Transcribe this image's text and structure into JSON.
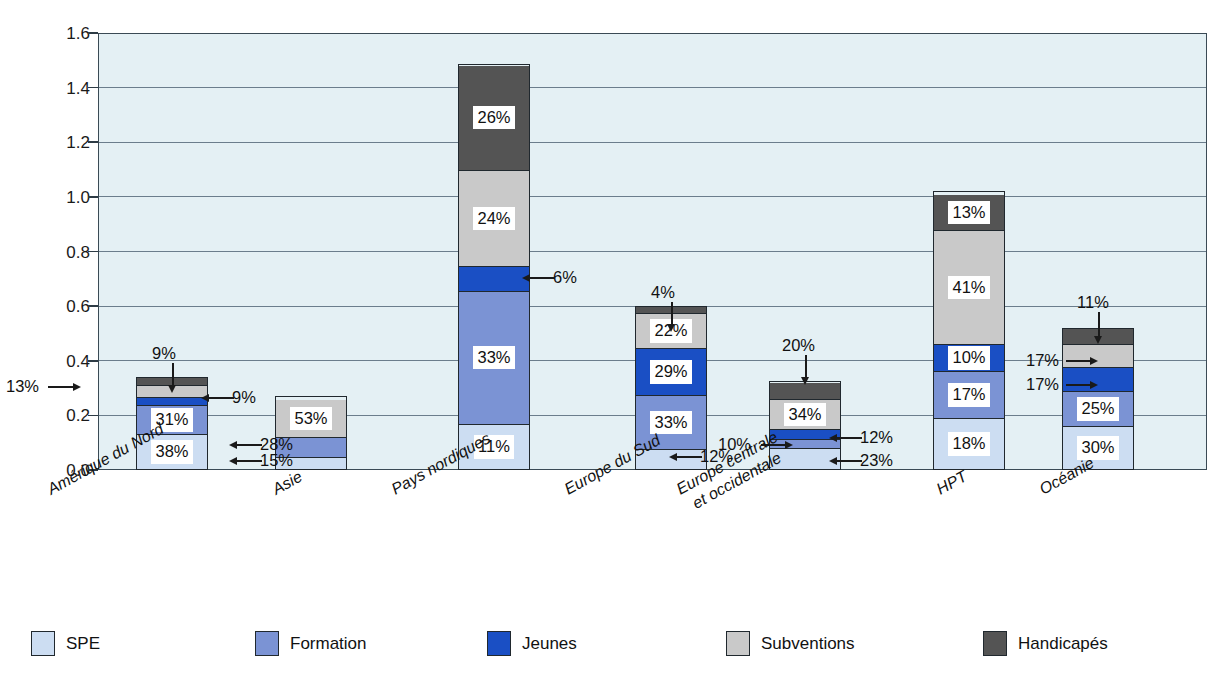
{
  "axis": {
    "ylabel": "% du PIB",
    "yticks": [
      "1.6",
      "1.4",
      "1.2",
      "1.0",
      "0.8",
      "0.6",
      "0.4",
      "0.2",
      "0.0"
    ]
  },
  "legend": {
    "items": [
      {
        "label": "SPE",
        "color": "#ccddf2"
      },
      {
        "label": "Formation",
        "color": "#7b93d4"
      },
      {
        "label": "Jeunes",
        "color": "#1a4fc4"
      },
      {
        "label": "Subventions",
        "color": "#c9c9c9"
      },
      {
        "label": "Handicapés",
        "color": "#545454"
      }
    ]
  },
  "chart_data": {
    "type": "bar",
    "subtype": "stacked",
    "title": "",
    "xlabel": "",
    "ylabel": "% du PIB",
    "ylim": [
      0.0,
      1.6
    ],
    "ytick_step": 0.2,
    "grid": true,
    "legend_position": "bottom",
    "value_unit": "% du PIB",
    "label_unit": "% (part du total)",
    "categories": [
      "Amérique du Nord",
      "Asie",
      "Pays nordiques",
      "Europe du Sud",
      "Europe centrale et occidentale",
      "HPT",
      "Océanie"
    ],
    "series": [
      {
        "name": "SPE",
        "color": "#ccddf2",
        "shares_pct": [
          38,
          15,
          11,
          12,
          23,
          18,
          30
        ],
        "values": [
          0.129,
          0.041,
          0.163,
          0.072,
          0.075,
          0.184,
          0.156
        ]
      },
      {
        "name": "Formation",
        "color": "#7b93d4",
        "shares_pct": [
          31,
          28,
          33,
          33,
          10,
          17,
          25
        ],
        "values": [
          0.105,
          0.076,
          0.49,
          0.198,
          0.033,
          0.173,
          0.13
        ]
      },
      {
        "name": "Jeunes",
        "color": "#1a4fc4",
        "shares_pct": [
          9,
          0,
          6,
          29,
          12,
          10,
          17
        ],
        "values": [
          0.031,
          0.0,
          0.089,
          0.174,
          0.039,
          0.102,
          0.088
        ]
      },
      {
        "name": "Subventions",
        "color": "#c9c9c9",
        "shares_pct": [
          13,
          53,
          24,
          22,
          34,
          41,
          17
        ],
        "values": [
          0.044,
          0.143,
          0.356,
          0.132,
          0.111,
          0.418,
          0.088
        ]
      },
      {
        "name": "Handicapés",
        "color": "#545454",
        "shares_pct": [
          9,
          0,
          26,
          4,
          20,
          13,
          11
        ],
        "values": [
          0.031,
          0.0,
          0.386,
          0.024,
          0.065,
          0.133,
          0.057
        ]
      }
    ],
    "totals": [
      0.34,
      0.27,
      1.485,
      0.6,
      0.325,
      1.02,
      0.52
    ],
    "data_labels": [
      {
        "category": "Amérique du Nord",
        "series": "SPE",
        "text": "38%",
        "placement": "inside"
      },
      {
        "category": "Amérique du Nord",
        "series": "Formation",
        "text": "31%",
        "placement": "inside"
      },
      {
        "category": "Amérique du Nord",
        "series": "Jeunes",
        "text": "9%",
        "placement": "callout-right"
      },
      {
        "category": "Amérique du Nord",
        "series": "Subventions",
        "text": "13%",
        "placement": "callout-left"
      },
      {
        "category": "Amérique du Nord",
        "series": "Handicapés",
        "text": "9%",
        "placement": "callout-top"
      },
      {
        "category": "Asie",
        "series": "SPE",
        "text": "15%",
        "placement": "callout-right"
      },
      {
        "category": "Asie",
        "series": "Formation",
        "text": "28%",
        "placement": "callout-right"
      },
      {
        "category": "Asie",
        "series": "Subventions",
        "text": "53%",
        "placement": "inside"
      },
      {
        "category": "Pays nordiques",
        "series": "SPE",
        "text": "11%",
        "placement": "inside"
      },
      {
        "category": "Pays nordiques",
        "series": "Formation",
        "text": "33%",
        "placement": "inside"
      },
      {
        "category": "Pays nordiques",
        "series": "Jeunes",
        "text": "6%",
        "placement": "callout-right"
      },
      {
        "category": "Pays nordiques",
        "series": "Subventions",
        "text": "24%",
        "placement": "inside"
      },
      {
        "category": "Pays nordiques",
        "series": "Handicapés",
        "text": "26%",
        "placement": "inside"
      },
      {
        "category": "Europe du Sud",
        "series": "SPE",
        "text": "12%",
        "placement": "callout-right"
      },
      {
        "category": "Europe du Sud",
        "series": "Formation",
        "text": "33%",
        "placement": "inside"
      },
      {
        "category": "Europe du Sud",
        "series": "Jeunes",
        "text": "29%",
        "placement": "inside"
      },
      {
        "category": "Europe du Sud",
        "series": "Subventions",
        "text": "22%",
        "placement": "inside"
      },
      {
        "category": "Europe du Sud",
        "series": "Handicapés",
        "text": "4%",
        "placement": "callout-top"
      },
      {
        "category": "Europe centrale et occidentale",
        "series": "SPE",
        "text": "23%",
        "placement": "callout-right"
      },
      {
        "category": "Europe centrale et occidentale",
        "series": "Formation",
        "text": "10%",
        "placement": "callout-left"
      },
      {
        "category": "Europe centrale et occidentale",
        "series": "Jeunes",
        "text": "12%",
        "placement": "callout-right"
      },
      {
        "category": "Europe centrale et occidentale",
        "series": "Subventions",
        "text": "34%",
        "placement": "inside"
      },
      {
        "category": "Europe centrale et occidentale",
        "series": "Handicapés",
        "text": "20%",
        "placement": "callout-top"
      },
      {
        "category": "HPT",
        "series": "SPE",
        "text": "18%",
        "placement": "inside"
      },
      {
        "category": "HPT",
        "series": "Formation",
        "text": "17%",
        "placement": "inside"
      },
      {
        "category": "HPT",
        "series": "Jeunes",
        "text": "10%",
        "placement": "inside"
      },
      {
        "category": "HPT",
        "series": "Subventions",
        "text": "41%",
        "placement": "inside"
      },
      {
        "category": "HPT",
        "series": "Handicapés",
        "text": "13%",
        "placement": "inside"
      },
      {
        "category": "Océanie",
        "series": "SPE",
        "text": "30%",
        "placement": "inside"
      },
      {
        "category": "Océanie",
        "series": "Formation",
        "text": "25%",
        "placement": "inside"
      },
      {
        "category": "Océanie",
        "series": "Jeunes",
        "text": "17%",
        "placement": "callout-left"
      },
      {
        "category": "Océanie",
        "series": "Subventions",
        "text": "17%",
        "placement": "callout-left"
      },
      {
        "category": "Océanie",
        "series": "Handicapés",
        "text": "11%",
        "placement": "callout-top"
      }
    ]
  },
  "xlabels": [
    {
      "lines": [
        "Amérique du Nord"
      ]
    },
    {
      "lines": [
        "Asie"
      ]
    },
    {
      "lines": [
        "Pays nordiques"
      ]
    },
    {
      "lines": [
        "Europe du Sud"
      ]
    },
    {
      "lines": [
        "Europe centrale",
        "et occidentale"
      ]
    },
    {
      "lines": [
        "HPT"
      ]
    },
    {
      "lines": [
        "Océanie"
      ]
    }
  ],
  "callouts": [
    {
      "text": "9%",
      "tx": 152,
      "ty": 345,
      "dir": "down",
      "ax": 172,
      "ay": 363,
      "len": 22
    },
    {
      "text": "13%",
      "tx": 6,
      "ty": 378,
      "dir": "right",
      "ax": 48,
      "ay": 386,
      "len": 25
    },
    {
      "text": "9%",
      "tx": 232,
      "ty": 389,
      "dir": "left",
      "ax": 209,
      "ay": 397,
      "len": 25
    },
    {
      "text": "28%",
      "tx": 260,
      "ty": 436,
      "dir": "left",
      "ax": 237,
      "ay": 444,
      "len": 25
    },
    {
      "text": "15%",
      "tx": 260,
      "ty": 452,
      "dir": "left",
      "ax": 237,
      "ay": 460,
      "len": 25
    },
    {
      "text": "6%",
      "tx": 553,
      "ty": 269,
      "dir": "left",
      "ax": 530,
      "ay": 277,
      "len": 25
    },
    {
      "text": "4%",
      "tx": 651,
      "ty": 284,
      "dir": "down",
      "ax": 671,
      "ay": 302,
      "len": 22
    },
    {
      "text": "12%",
      "tx": 700,
      "ty": 448,
      "dir": "left",
      "ax": 677,
      "ay": 456,
      "len": 25
    },
    {
      "text": "20%",
      "tx": 782,
      "ty": 337,
      "dir": "down",
      "ax": 805,
      "ay": 355,
      "len": 22
    },
    {
      "text": "10%",
      "tx": 718,
      "ty": 436,
      "dir": "right",
      "ax": 761,
      "ay": 444,
      "len": 24
    },
    {
      "text": "12%",
      "tx": 860,
      "ty": 429,
      "dir": "left",
      "ax": 837,
      "ay": 437,
      "len": 25
    },
    {
      "text": "23%",
      "tx": 860,
      "ty": 452,
      "dir": "left",
      "ax": 837,
      "ay": 460,
      "len": 25
    },
    {
      "text": "11%",
      "tx": 1077,
      "ty": 294,
      "dir": "down",
      "ax": 1098,
      "ay": 312,
      "len": 24
    },
    {
      "text": "17%",
      "tx": 1026,
      "ty": 352,
      "dir": "right",
      "ax": 1066,
      "ay": 360,
      "len": 24
    },
    {
      "text": "17%",
      "tx": 1026,
      "ty": 376,
      "dir": "right",
      "ax": 1066,
      "ay": 384,
      "len": 24
    }
  ]
}
